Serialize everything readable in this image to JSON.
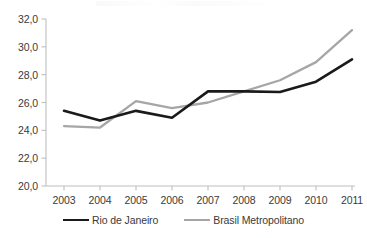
{
  "chart_data": {
    "type": "line",
    "title": "",
    "xlabel": "",
    "ylabel": "",
    "categories": [
      "2003",
      "2004",
      "2005",
      "2006",
      "2007",
      "2008",
      "2009",
      "2010",
      "2011"
    ],
    "ylim": [
      20.0,
      32.0
    ],
    "ytick_labels": [
      "32,0",
      "30,0",
      "28,0",
      "26,0",
      "24,0",
      "22,0",
      "20,0"
    ],
    "ytick_values": [
      32.0,
      30.0,
      28.0,
      26.0,
      24.0,
      22.0,
      20.0
    ],
    "grid": false,
    "legend_position": "bottom",
    "decimal_separator": ",",
    "series": [
      {
        "name": "Rio de Janeiro",
        "color": "#1a1a1a",
        "values": [
          25.4,
          24.7,
          25.4,
          24.9,
          26.8,
          26.8,
          26.75,
          27.5,
          29.1
        ]
      },
      {
        "name": "Brasil Metropolitano",
        "color": "#a6a6a6",
        "values": [
          24.3,
          24.2,
          26.1,
          25.6,
          26.0,
          26.8,
          27.6,
          28.9,
          31.2
        ]
      }
    ]
  },
  "legend": {
    "items": [
      {
        "label": "Rio de Janeiro"
      },
      {
        "label": "Brasil Metropolitano"
      }
    ]
  },
  "axis": {
    "color": "#bfbfbf"
  }
}
